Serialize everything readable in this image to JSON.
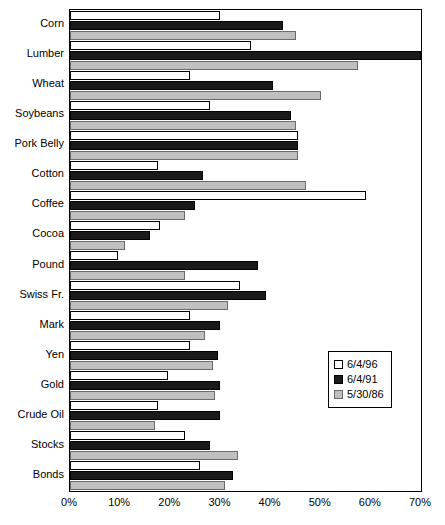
{
  "chart_data": {
    "type": "bar",
    "orientation": "horizontal",
    "title": "",
    "xlabel": "",
    "ylabel": "",
    "xlim": [
      0,
      70
    ],
    "grid": false,
    "legend_position": "center-right",
    "xtick_labels": [
      "0%",
      "10%",
      "20%",
      "30%",
      "40%",
      "50%",
      "60%",
      "70%"
    ],
    "xtick_values": [
      0,
      10,
      20,
      30,
      40,
      50,
      60,
      70
    ],
    "categories": [
      "Corn",
      "Lumber",
      "Wheat",
      "Soybeans",
      "Pork Belly",
      "Cotton",
      "Coffee",
      "Cocoa",
      "Pound",
      "Swiss Fr.",
      "Mark",
      "Yen",
      "Gold",
      "Crude Oil",
      "Stocks",
      "Bonds"
    ],
    "series": [
      {
        "name": "6/4/96",
        "color": "#ffffff",
        "values": [
          30,
          36,
          24,
          28,
          45.5,
          17.5,
          59,
          18,
          9.5,
          34,
          24,
          24,
          19.5,
          17.5,
          23,
          26
        ]
      },
      {
        "name": "6/4/91",
        "color": "#1a1a1a",
        "values": [
          42.5,
          70,
          40.5,
          44,
          45.5,
          26.5,
          25,
          16,
          37.5,
          39,
          30,
          29.5,
          30,
          30,
          28,
          32.5
        ]
      },
      {
        "name": "5/30/86",
        "color": "#bfbfbf",
        "values": [
          45,
          57.5,
          50,
          45,
          45.5,
          47,
          23,
          11,
          23,
          31.5,
          27,
          28.5,
          29,
          17,
          33.5,
          31
        ]
      }
    ]
  },
  "legend": {
    "entries": [
      {
        "label": "6/4/96"
      },
      {
        "label": "6/4/91"
      },
      {
        "label": "5/30/86"
      }
    ]
  }
}
